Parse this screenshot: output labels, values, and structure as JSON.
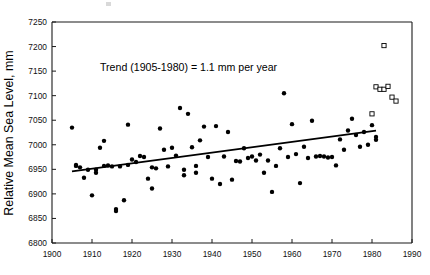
{
  "chart_data": {
    "type": "scatter",
    "title": "",
    "xlabel": "",
    "ylabel": "Relative Mean Sea Level, mm",
    "xlim": [
      1900,
      1990
    ],
    "ylim": [
      6800,
      7250
    ],
    "xticks": [
      1900,
      1910,
      1920,
      1930,
      1940,
      1950,
      1960,
      1970,
      1980,
      1990
    ],
    "yticks": [
      6800,
      6850,
      6900,
      6950,
      7000,
      7050,
      7100,
      7150,
      7200,
      7250
    ],
    "grid": false,
    "legend": "none",
    "annotations": [
      {
        "text": "Trend (1905-1980) = 1.1 mm per year",
        "x": 1912,
        "y": 7150
      }
    ],
    "trend_line": {
      "label": "Trend (1905-1980) = 1.1 mm per year",
      "slope_mm_per_year": 1.1,
      "start_year": 1905,
      "end_year": 1981,
      "start_value": 6946,
      "end_value": 7029
    },
    "series": [
      {
        "name": "annual-mean-sea-level",
        "marker": "filled-circle",
        "points": [
          [
            1905,
            7035
          ],
          [
            1906,
            6957
          ],
          [
            1906,
            6959
          ],
          [
            1907,
            6954
          ],
          [
            1908,
            6933
          ],
          [
            1909,
            6949
          ],
          [
            1910,
            6897
          ],
          [
            1911,
            6949
          ],
          [
            1911,
            6943
          ],
          [
            1912,
            6994
          ],
          [
            1913,
            7008
          ],
          [
            1913,
            6957
          ],
          [
            1914,
            6958
          ],
          [
            1915,
            6956
          ],
          [
            1916,
            6869
          ],
          [
            1916,
            6865
          ],
          [
            1917,
            6956
          ],
          [
            1918,
            6887
          ],
          [
            1919,
            7041
          ],
          [
            1919,
            6959
          ],
          [
            1920,
            6970
          ],
          [
            1921,
            6965
          ],
          [
            1922,
            6977
          ],
          [
            1923,
            6975
          ],
          [
            1924,
            6931
          ],
          [
            1925,
            6911
          ],
          [
            1925,
            6954
          ],
          [
            1926,
            6952
          ],
          [
            1927,
            7033
          ],
          [
            1928,
            6990
          ],
          [
            1929,
            6956
          ],
          [
            1930,
            6994
          ],
          [
            1931,
            6978
          ],
          [
            1932,
            7075
          ],
          [
            1933,
            6938
          ],
          [
            1933,
            6949
          ],
          [
            1934,
            7063
          ],
          [
            1935,
            6995
          ],
          [
            1936,
            6957
          ],
          [
            1936,
            6943
          ],
          [
            1937,
            7009
          ],
          [
            1938,
            7037
          ],
          [
            1939,
            6975
          ],
          [
            1940,
            6931
          ],
          [
            1941,
            7038
          ],
          [
            1942,
            6920
          ],
          [
            1943,
            6976
          ],
          [
            1944,
            7026
          ],
          [
            1945,
            6929
          ],
          [
            1946,
            6967
          ],
          [
            1947,
            6966
          ],
          [
            1948,
            6993
          ],
          [
            1949,
            6973
          ],
          [
            1950,
            6976
          ],
          [
            1951,
            6968
          ],
          [
            1952,
            6980
          ],
          [
            1953,
            6943
          ],
          [
            1954,
            6968
          ],
          [
            1955,
            6904
          ],
          [
            1956,
            6957
          ],
          [
            1957,
            6993
          ],
          [
            1958,
            7105
          ],
          [
            1959,
            6975
          ],
          [
            1960,
            7042
          ],
          [
            1961,
            6981
          ],
          [
            1962,
            6922
          ],
          [
            1963,
            6996
          ],
          [
            1964,
            6973
          ],
          [
            1965,
            7049
          ],
          [
            1966,
            6976
          ],
          [
            1967,
            6977
          ],
          [
            1968,
            6976
          ],
          [
            1969,
            6974
          ],
          [
            1970,
            6975
          ],
          [
            1971,
            6958
          ],
          [
            1972,
            7011
          ],
          [
            1973,
            6990
          ],
          [
            1974,
            7029
          ],
          [
            1975,
            7053
          ],
          [
            1976,
            7020
          ],
          [
            1977,
            6996
          ],
          [
            1978,
            7026
          ],
          [
            1979,
            7000
          ],
          [
            1980,
            7040
          ],
          [
            1981,
            7016
          ],
          [
            1981,
            7010
          ]
        ]
      },
      {
        "name": "recent-sea-level",
        "marker": "open-square",
        "points": [
          [
            1980,
            7063
          ],
          [
            1981,
            7118
          ],
          [
            1982,
            7113
          ],
          [
            1983,
            7113
          ],
          [
            1983,
            7202
          ],
          [
            1984,
            7119
          ],
          [
            1985,
            7097
          ],
          [
            1986,
            7089
          ]
        ]
      }
    ]
  },
  "figure": {
    "background": "#ffffff",
    "axis_color": "#1a1a1a",
    "marker_color": "#000000",
    "trend_color": "#000000"
  }
}
